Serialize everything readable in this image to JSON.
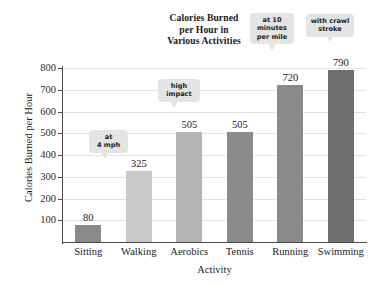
{
  "chart_data": {
    "type": "bar",
    "title": "Calories Burned per Hour in Various Activities",
    "title_lines": [
      "Calories Burned",
      "per Hour in",
      "Various Activities"
    ],
    "xlabel": "Activity",
    "ylabel": "Calories Burned per Hour",
    "categories": [
      "Sitting",
      "Walking",
      "Aerobics",
      "Tennis",
      "Running",
      "Swimming"
    ],
    "values": [
      80,
      325,
      505,
      505,
      720,
      790
    ],
    "value_labels": [
      "80",
      "325",
      "505",
      "505",
      "720",
      "790"
    ],
    "bar_colors": [
      "#8a8a8a",
      "#c8c8c8",
      "#b5b5b5",
      "#8a8a8a",
      "#8a8a8a",
      "#6f6f6f"
    ],
    "ylim": [
      0,
      800
    ],
    "yticks": [
      100,
      200,
      300,
      400,
      500,
      600,
      700,
      800
    ],
    "ytick_labels": [
      "100",
      "200",
      "300",
      "400",
      "500",
      "600",
      "700",
      "800"
    ],
    "grid": true,
    "grid_axis": "y",
    "legend": "none",
    "annotations": [
      {
        "category": "Walking",
        "lines": [
          "at",
          "4 mph"
        ]
      },
      {
        "category": "Aerobics",
        "lines": [
          "high",
          "impact"
        ]
      },
      {
        "category": "Running",
        "lines": [
          "at 10",
          "minutes",
          "per mile"
        ]
      },
      {
        "category": "Swimming",
        "lines": [
          "with crawl",
          "stroke"
        ]
      }
    ]
  },
  "callouts": {
    "walking": {
      "l1": "at",
      "l2": "4 mph",
      "l3": ""
    },
    "aerobics": {
      "l1": "high",
      "l2": "impact",
      "l3": ""
    },
    "running": {
      "l1": "at 10",
      "l2": "minutes",
      "l3": "per mile"
    },
    "swimming": {
      "l1": "with crawl",
      "l2": "stroke",
      "l3": ""
    }
  }
}
